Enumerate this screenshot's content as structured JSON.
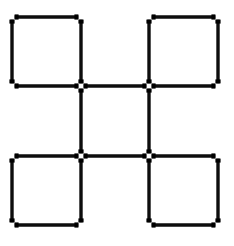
{
  "figure": {
    "background_color": "#ffffff",
    "stick_color": "#0d0d0d",
    "cap_color": "#000000",
    "stick_thickness": 3.4,
    "cap_thickness": 5.2,
    "cap_length": 4,
    "gap": 2.6,
    "canvas": {
      "width": 234,
      "height": 246
    },
    "grid": {
      "x_lines": [
        12,
        81,
        149,
        218
      ],
      "y_lines": [
        17,
        86,
        156,
        225
      ],
      "columns": 3,
      "rows": 3
    },
    "squares": [
      {
        "name": "top-left-square",
        "col": 0,
        "row": 0
      },
      {
        "name": "top-right-square",
        "col": 2,
        "row": 0
      },
      {
        "name": "bottom-left-square",
        "col": 0,
        "row": 2
      },
      {
        "name": "bottom-right-square",
        "col": 2,
        "row": 2
      }
    ],
    "matchsticks": [
      {
        "name": "stick-h-top-left",
        "orientation": "horizontal",
        "x1": 12,
        "y1": 17,
        "x2": 81,
        "y2": 17
      },
      {
        "name": "stick-h-top-right",
        "orientation": "horizontal",
        "x1": 149,
        "y1": 17,
        "x2": 218,
        "y2": 17
      },
      {
        "name": "stick-h-middle-left",
        "orientation": "horizontal",
        "x1": 12,
        "y1": 86,
        "x2": 81,
        "y2": 86
      },
      {
        "name": "stick-h-middle-center",
        "orientation": "horizontal",
        "x1": 81,
        "y1": 86,
        "x2": 149,
        "y2": 86
      },
      {
        "name": "stick-h-middle-right",
        "orientation": "horizontal",
        "x1": 149,
        "y1": 86,
        "x2": 218,
        "y2": 86
      },
      {
        "name": "stick-h-lower-left",
        "orientation": "horizontal",
        "x1": 12,
        "y1": 156,
        "x2": 81,
        "y2": 156
      },
      {
        "name": "stick-h-lower-center",
        "orientation": "horizontal",
        "x1": 81,
        "y1": 156,
        "x2": 149,
        "y2": 156
      },
      {
        "name": "stick-h-lower-right",
        "orientation": "horizontal",
        "x1": 149,
        "y1": 156,
        "x2": 218,
        "y2": 156
      },
      {
        "name": "stick-h-bottom-left",
        "orientation": "horizontal",
        "x1": 12,
        "y1": 225,
        "x2": 81,
        "y2": 225
      },
      {
        "name": "stick-h-bottom-right",
        "orientation": "horizontal",
        "x1": 149,
        "y1": 225,
        "x2": 218,
        "y2": 225
      },
      {
        "name": "stick-v-left-top",
        "orientation": "vertical",
        "x1": 12,
        "y1": 17,
        "x2": 12,
        "y2": 86
      },
      {
        "name": "stick-v-left-bottom",
        "orientation": "vertical",
        "x1": 12,
        "y1": 156,
        "x2": 12,
        "y2": 225
      },
      {
        "name": "stick-v-midleft-top",
        "orientation": "vertical",
        "x1": 81,
        "y1": 17,
        "x2": 81,
        "y2": 86
      },
      {
        "name": "stick-v-midleft-center",
        "orientation": "vertical",
        "x1": 81,
        "y1": 86,
        "x2": 81,
        "y2": 156
      },
      {
        "name": "stick-v-midleft-bottom",
        "orientation": "vertical",
        "x1": 81,
        "y1": 156,
        "x2": 81,
        "y2": 225
      },
      {
        "name": "stick-v-midright-top",
        "orientation": "vertical",
        "x1": 149,
        "y1": 17,
        "x2": 149,
        "y2": 86
      },
      {
        "name": "stick-v-midright-center",
        "orientation": "vertical",
        "x1": 149,
        "y1": 86,
        "x2": 149,
        "y2": 156
      },
      {
        "name": "stick-v-midright-bottom",
        "orientation": "vertical",
        "x1": 149,
        "y1": 156,
        "x2": 149,
        "y2": 225
      },
      {
        "name": "stick-v-right-top",
        "orientation": "vertical",
        "x1": 218,
        "y1": 17,
        "x2": 218,
        "y2": 86
      },
      {
        "name": "stick-v-right-bottom",
        "orientation": "vertical",
        "x1": 218,
        "y1": 156,
        "x2": 218,
        "y2": 225
      }
    ]
  }
}
